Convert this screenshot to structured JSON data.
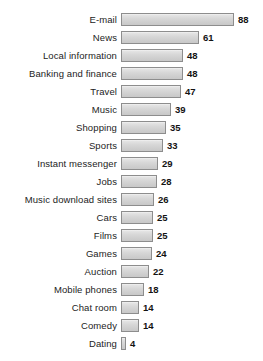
{
  "chart_data": {
    "type": "bar",
    "orientation": "horizontal",
    "title": "",
    "subtitle": "",
    "xlabel": "",
    "ylabel": "",
    "grid": false,
    "legend": null,
    "legend_position": "none",
    "xlim": [
      0,
      88
    ],
    "value_labels_shown": true,
    "categories": [
      "E-mail",
      "News",
      "Local information",
      "Banking and finance",
      "Travel",
      "Music",
      "Shopping",
      "Sports",
      "Instant messenger",
      "Jobs",
      "Music download sites",
      "Cars",
      "Films",
      "Games",
      "Auction",
      "Mobile phones",
      "Chat room",
      "Comedy",
      "Dating"
    ],
    "values": [
      88,
      61,
      48,
      48,
      47,
      39,
      35,
      33,
      29,
      28,
      26,
      25,
      25,
      24,
      22,
      18,
      14,
      14,
      4
    ],
    "value_label_texts": [
      "88",
      "61",
      "48",
      "48",
      "47",
      "39",
      "35",
      "33",
      "29",
      "28",
      "26",
      "25",
      "25",
      "24",
      "22",
      "18",
      "14",
      "14",
      "4"
    ]
  },
  "style": {
    "bar_fill": "#d6d6d6",
    "bar_border": "#8d8d8d",
    "label_color": "#232323",
    "value_color": "#131313",
    "background": "#ffffff"
  }
}
